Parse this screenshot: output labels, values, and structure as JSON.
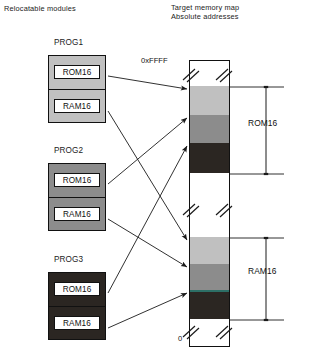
{
  "headers": {
    "left": "Relocatable modules",
    "right_line1": "Target memory map",
    "right_line2": "Absolute addresses"
  },
  "modules": [
    {
      "title": "PROG1",
      "fill": "#c0c0c0",
      "rom_label": "ROM16",
      "ram_label": "RAM16",
      "x": 48,
      "y": 55,
      "w": 58,
      "h": 68
    },
    {
      "title": "PROG2",
      "fill": "#8c8c8c",
      "rom_label": "ROM16",
      "ram_label": "RAM16",
      "x": 48,
      "y": 163,
      "w": 58,
      "h": 68
    },
    {
      "title": "PROG3",
      "fill": "#2b2622",
      "rom_label": "ROM16",
      "ram_label": "RAM16",
      "x": 48,
      "y": 272,
      "w": 58,
      "h": 68
    }
  ],
  "memory_map": {
    "top_address": "0xFFFF",
    "bottom_address": "0",
    "bar": {
      "x": 189,
      "y": 60,
      "w": 41,
      "h": 287
    },
    "bands": [
      {
        "name": "rom-prog1",
        "top": 87,
        "height": 29,
        "fill": "#c0c0c0"
      },
      {
        "name": "rom-prog2",
        "top": 116,
        "height": 28,
        "fill": "#8c8c8c"
      },
      {
        "name": "rom-prog3",
        "top": 144,
        "height": 30,
        "fill": "#2b2622"
      },
      {
        "name": "ram-prog1",
        "top": 238,
        "height": 27,
        "fill": "#c0c0c0"
      },
      {
        "name": "ram-prog2",
        "top": 265,
        "height": 26,
        "fill": "#8c8c8c"
      },
      {
        "name": "ram-prog3",
        "top": 291,
        "height": 29,
        "fill": "#2b2622"
      }
    ],
    "teal_divider": {
      "top": 291,
      "color": "#2d6f66"
    }
  },
  "dimensions": [
    {
      "label": "ROM16",
      "x": 286,
      "top": 87,
      "bottom": 174,
      "label_y": 124
    },
    {
      "label": "RAM16",
      "x": 286,
      "top": 238,
      "bottom": 320,
      "label_y": 272
    }
  ],
  "connectors": [
    {
      "from": "prog1-rom",
      "x1": 108,
      "y1": 76,
      "x2": 187,
      "y2": 89
    },
    {
      "from": "prog1-ram",
      "x1": 108,
      "y1": 111,
      "x2": 187,
      "y2": 240
    },
    {
      "from": "prog2-rom",
      "x1": 108,
      "y1": 184,
      "x2": 187,
      "y2": 118
    },
    {
      "from": "prog2-ram",
      "x1": 108,
      "y1": 219,
      "x2": 187,
      "y2": 267
    },
    {
      "from": "prog3-rom",
      "x1": 108,
      "y1": 293,
      "x2": 187,
      "y2": 146
    },
    {
      "from": "prog3-ram",
      "x1": 108,
      "y1": 328,
      "x2": 187,
      "y2": 293
    }
  ],
  "colors": {
    "ink": "#111111",
    "light_gray": "#c0c0c0",
    "mid_gray": "#8c8c8c",
    "dark": "#2b2622",
    "teal": "#2d6f66"
  }
}
